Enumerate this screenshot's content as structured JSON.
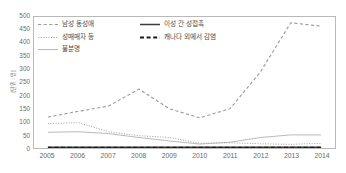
{
  "chart_data": {
    "type": "line",
    "title": "",
    "xlabel": "",
    "ylabel": "[단위 : 명]",
    "categories": [
      "2005",
      "2006",
      "2007",
      "2008",
      "2009",
      "2010",
      "2011",
      "2012",
      "2013",
      "2014"
    ],
    "x": [
      2005,
      2006,
      2007,
      2008,
      2009,
      2010,
      2011,
      2012,
      2013,
      2014
    ],
    "ylim": [
      0,
      500
    ],
    "yticks": [
      0,
      50,
      100,
      150,
      200,
      250,
      300,
      350,
      400,
      450,
      500
    ],
    "grid": false,
    "legend_position": "top-left",
    "series": [
      {
        "name": "남성 동성애",
        "style": "dashed",
        "color": "#9a9a9a",
        "values": [
          118,
          140,
          160,
          225,
          150,
          115,
          150,
          290,
          478,
          465
        ]
      },
      {
        "name": "성매매자 등",
        "style": "dotted",
        "color": "#a6a6a6",
        "values": [
          93,
          97,
          62,
          47,
          40,
          18,
          20,
          16,
          14,
          18
        ]
      },
      {
        "name": "불분명",
        "style": "solid-thin",
        "color": "#b0b0b0",
        "values": [
          60,
          62,
          55,
          40,
          27,
          15,
          22,
          40,
          50,
          50
        ]
      },
      {
        "name": "이성 간 성접촉",
        "style": "solid",
        "color": "#3b3b3b",
        "values": [
          3,
          3,
          3,
          3,
          3,
          3,
          3,
          3,
          3,
          3
        ]
      },
      {
        "name": "캐나다 외에서 감염",
        "style": "dashed-bold",
        "color": "#1a1a1a",
        "values": [
          1,
          1,
          1,
          1,
          1,
          1,
          1,
          1,
          1,
          1
        ]
      }
    ]
  },
  "legend": {
    "items": [
      {
        "label": "남성 동성애"
      },
      {
        "label": "성매매자 등"
      },
      {
        "label": "불분명"
      },
      {
        "label": "이성 간 성접촉"
      },
      {
        "label": "캐나다 외에서 감염"
      }
    ]
  },
  "axis": {
    "y_unit_label": "[단위 : 명]"
  }
}
